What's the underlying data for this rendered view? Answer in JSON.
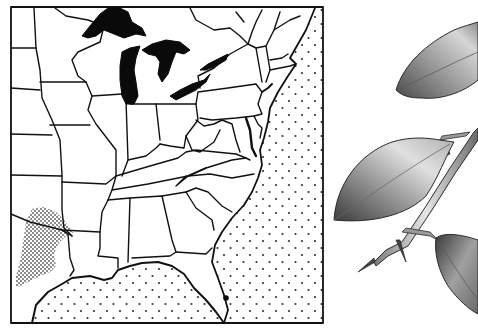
{
  "figure": {
    "map": {
      "region": "Eastern United States",
      "frame": {
        "x": 10,
        "y": 6,
        "width": 313,
        "height": 318
      },
      "colors": {
        "land": "#ffffff",
        "border": "#111111",
        "lakes": "#0a0a0a",
        "ocean_dot": "#333333",
        "range_stipple": "#555555"
      },
      "legend": {
        "ocean_pattern": "sparse dots",
        "range_pattern": "dense stipple",
        "range_location": "north-central Texas / southern Oklahoma"
      },
      "markers": [
        {
          "name": "south-florida-dot",
          "x": 226,
          "y": 298
        }
      ]
    },
    "illustration": {
      "subject": "thorny branch with leaves",
      "leaves": 3,
      "thorns": 3,
      "colors": {
        "ink": "#2b2b2b",
        "shade_dark": "#5a5a5a",
        "shade_mid": "#9a9a9a",
        "shade_light": "#d6d6d6"
      }
    }
  }
}
